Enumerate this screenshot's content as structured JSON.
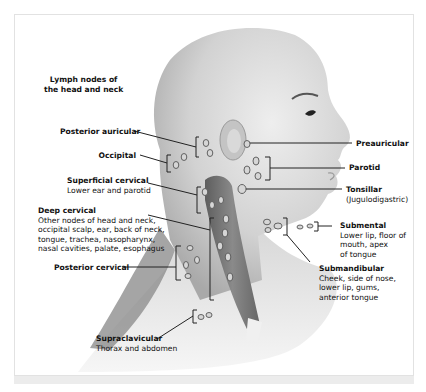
{
  "figure": {
    "title_line1": "Lymph nodes of",
    "title_line2": "the head and neck",
    "colors": {
      "skin": "#cfcfcf",
      "skin_dark": "#9a9a9a",
      "muscle": "#7a7a7a",
      "node_fill": "#d6d6d6",
      "node_stroke": "#555555",
      "leader": "#222222",
      "frame_border": "#e2e2e2"
    },
    "labels": {
      "posterior_auricular": {
        "name": "Posterior auricular",
        "desc": ""
      },
      "occipital": {
        "name": "Occipital",
        "desc": ""
      },
      "superficial_cervical": {
        "name": "Superficial cervical",
        "desc": "Lower ear and parotid"
      },
      "deep_cervical": {
        "name": "Deep cervical",
        "desc_lines": [
          "Other nodes of head and neck,",
          "occipital scalp, ear, back of neck,",
          "tongue, trachea, nasopharynx,",
          "nasal cavities, palate, esophagus"
        ]
      },
      "posterior_cervical": {
        "name": "Posterior cervical",
        "desc": ""
      },
      "supraclavicular": {
        "name": "Supraclavicular",
        "desc": "Thorax and abdomen"
      },
      "preauricular": {
        "name": "Preauricular",
        "desc": ""
      },
      "parotid": {
        "name": "Parotid",
        "desc": ""
      },
      "tonsillar": {
        "name": "Tonsillar",
        "desc": "(Jugulodigastric)"
      },
      "submental": {
        "name": "Submental",
        "desc_lines": [
          "Lower lip, floor of",
          "mouth, apex",
          "of tongue"
        ]
      },
      "submandibular": {
        "name": "Submandibular",
        "desc_lines": [
          "Cheek, side of nose,",
          "lower lip, gums,",
          "anterior tongue"
        ]
      }
    }
  }
}
